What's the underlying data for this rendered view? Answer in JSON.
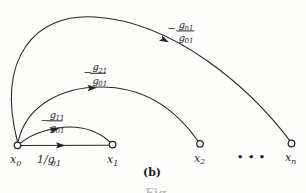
{
  "figure": {
    "type": "signal-flow-graph",
    "panel_label": "(b)",
    "caption_fragment": "Fig.",
    "ellipsis": "•••",
    "ink_color": "#262626",
    "background_color": "#fdfdfc",
    "nodes": {
      "x0": {
        "base": "x",
        "sub": "0"
      },
      "x1": {
        "base": "x",
        "sub": "1"
      },
      "x2": {
        "base": "x",
        "sub": "2"
      },
      "xn": {
        "base": "x",
        "sub": "n"
      }
    },
    "edges": {
      "x1_to_x0_direct": {
        "from": "x1",
        "to": "x0",
        "gain_base": "1/g",
        "gain_sub": "01"
      },
      "x1_to_x0_arc": {
        "from": "x1",
        "to": "x0",
        "sign": "−",
        "num_base": "g",
        "num_sub": "11",
        "den_base": "g",
        "den_sub": "01"
      },
      "x2_to_x0_arc": {
        "from": "x2",
        "to": "x0",
        "sign": "−",
        "num_base": "g",
        "num_sub": "21",
        "den_base": "g",
        "den_sub": "01"
      },
      "xn_to_x0_arc": {
        "from": "xn",
        "to": "x0",
        "sign": "−",
        "num_base": "g",
        "num_sub": "n1",
        "den_base": "g",
        "den_sub": "01"
      }
    }
  }
}
